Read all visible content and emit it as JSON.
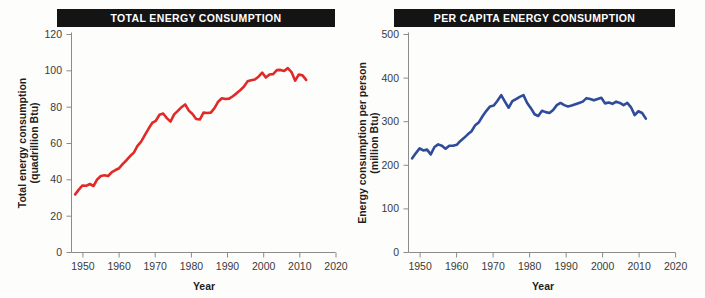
{
  "page": {
    "background_color": "#fdfdfc",
    "width": 705,
    "height": 298
  },
  "charts": [
    {
      "id": "total-energy-consumption",
      "title": "TOTAL ENERGY CONSUMPTION",
      "title_bar_color": "#141414",
      "title_text_color": "#ffffff",
      "xlabel": "Year",
      "ylabel_line1": "Total energy consumption",
      "ylabel_line2": "(quadrillion Btu)",
      "line_color": "#E02A28",
      "x_ticks": [
        "1950",
        "1960",
        "1970",
        "1980",
        "1990",
        "2000",
        "2010",
        "2020"
      ],
      "y_ticks": [
        "0",
        "20",
        "40",
        "60",
        "80",
        "100",
        "120"
      ]
    },
    {
      "id": "per-capita-energy-consumption",
      "title": "PER CAPITA ENERGY CONSUMPTION",
      "title_bar_color": "#141414",
      "title_text_color": "#ffffff",
      "xlabel": "Year",
      "ylabel_line1": "Energy consumption per person",
      "ylabel_line2": "(million Btu)",
      "line_color": "#2F4C9B",
      "x_ticks": [
        "1950",
        "1960",
        "1970",
        "1980",
        "1990",
        "2000",
        "2010",
        "2020"
      ],
      "y_ticks": [
        "0",
        "100",
        "200",
        "300",
        "400",
        "500"
      ]
    }
  ],
  "chart_data": [
    {
      "type": "line",
      "title": "TOTAL ENERGY CONSUMPTION",
      "xlabel": "Year",
      "ylabel": "Total energy consumption (quadrillion Btu)",
      "xlim": [
        1948,
        2020
      ],
      "ylim": [
        0,
        120
      ],
      "xticks": [
        1950,
        1960,
        1970,
        1980,
        1990,
        2000,
        2010,
        2020
      ],
      "yticks": [
        0,
        20,
        40,
        60,
        80,
        100,
        120
      ],
      "grid": false,
      "legend": "none",
      "color": "#E02A28",
      "series": [
        {
          "name": "Total energy consumption",
          "x": [
            1949,
            1950,
            1951,
            1952,
            1953,
            1954,
            1955,
            1956,
            1957,
            1958,
            1959,
            1960,
            1961,
            1962,
            1963,
            1964,
            1965,
            1966,
            1967,
            1968,
            1969,
            1970,
            1971,
            1972,
            1973,
            1974,
            1975,
            1976,
            1977,
            1978,
            1979,
            1980,
            1981,
            1982,
            1983,
            1984,
            1985,
            1986,
            1987,
            1988,
            1989,
            1990,
            1991,
            1992,
            1993,
            1994,
            1995,
            1996,
            1997,
            1998,
            1999,
            2000,
            2001,
            2002,
            2003,
            2004,
            2005,
            2006,
            2007,
            2008,
            2009,
            2010,
            2011,
            2012
          ],
          "values": [
            32,
            34.6,
            36.9,
            36.7,
            37.7,
            36.6,
            40.2,
            42.1,
            42.5,
            42.1,
            44.2,
            45.4,
            46.4,
            48.8,
            50.8,
            53.1,
            55.0,
            58.7,
            61.0,
            64.6,
            68.1,
            71.3,
            72.5,
            75.8,
            76.5,
            74.0,
            72.0,
            76.0,
            78.0,
            80.0,
            81.5,
            78.1,
            76.2,
            73.5,
            73.2,
            77.0,
            76.8,
            77.0,
            79.5,
            83.0,
            84.9,
            84.5,
            84.7,
            86.0,
            87.6,
            89.3,
            91.2,
            94.2,
            94.8,
            95.2,
            96.8,
            99.0,
            96.3,
            98.0,
            98.2,
            100.4,
            100.5,
            99.9,
            101.5,
            99.3,
            94.6,
            98.0,
            97.5,
            95.0
          ],
          "color": "#E02A28"
        }
      ]
    },
    {
      "type": "line",
      "title": "PER CAPITA ENERGY CONSUMPTION",
      "xlabel": "Year",
      "ylabel": "Energy consumption per person (million Btu)",
      "xlim": [
        1948,
        2020
      ],
      "ylim": [
        0,
        500
      ],
      "xticks": [
        1950,
        1960,
        1970,
        1980,
        1990,
        2000,
        2010,
        2020
      ],
      "yticks": [
        0,
        100,
        200,
        300,
        400,
        500
      ],
      "grid": false,
      "legend": "none",
      "color": "#2F4C9B",
      "series": [
        {
          "name": "Energy consumption per person",
          "x": [
            1949,
            1950,
            1951,
            1952,
            1953,
            1954,
            1955,
            1956,
            1957,
            1958,
            1959,
            1960,
            1961,
            1962,
            1963,
            1964,
            1965,
            1966,
            1967,
            1968,
            1969,
            1970,
            1971,
            1972,
            1973,
            1974,
            1975,
            1976,
            1977,
            1978,
            1979,
            1980,
            1981,
            1982,
            1983,
            1984,
            1985,
            1986,
            1987,
            1988,
            1989,
            1990,
            1991,
            1992,
            1993,
            1994,
            1995,
            1996,
            1997,
            1998,
            1999,
            2000,
            2001,
            2002,
            2003,
            2004,
            2005,
            2006,
            2007,
            2008,
            2009,
            2010,
            2011,
            2012
          ],
          "values": [
            216,
            228,
            239,
            234,
            236,
            225,
            242,
            248,
            245,
            238,
            245,
            245,
            247,
            256,
            263,
            271,
            278,
            292,
            299,
            313,
            325,
            335,
            337,
            348,
            361,
            346,
            332,
            347,
            352,
            357,
            361,
            343,
            331,
            317,
            313,
            325,
            322,
            320,
            327,
            338,
            343,
            338,
            335,
            337,
            340,
            343,
            346,
            354,
            352,
            349,
            352,
            355,
            342,
            344,
            341,
            346,
            343,
            338,
            343,
            333,
            315,
            324,
            320,
            307
          ],
          "color": "#2F4C9B"
        }
      ]
    }
  ]
}
